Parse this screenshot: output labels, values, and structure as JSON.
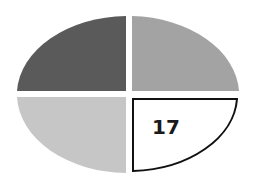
{
  "diagram": {
    "shape": "ellipse divided into four quadrants",
    "quadrants": [
      {
        "position": "top-left",
        "color": "#5a5a5a",
        "label": ""
      },
      {
        "position": "top-right",
        "color": "#a3a3a3",
        "label": ""
      },
      {
        "position": "bottom-left",
        "color": "#c6c6c6",
        "label": ""
      },
      {
        "position": "bottom-right",
        "color": "#ffffff",
        "outline": "#111111",
        "label": "17"
      }
    ]
  }
}
